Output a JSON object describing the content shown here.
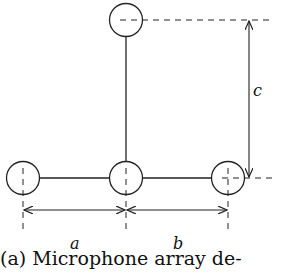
{
  "diagram": {
    "labels": {
      "a": "a",
      "b": "b",
      "c": "c"
    },
    "caption": "(a) Microphone array de-",
    "microphones": [
      {
        "id": "top",
        "x": 126,
        "y": 20
      },
      {
        "id": "left",
        "x": 23,
        "y": 178
      },
      {
        "id": "center",
        "x": 126,
        "y": 178
      },
      {
        "id": "right",
        "x": 228,
        "y": 178
      }
    ],
    "colors": {
      "stroke": "#222222",
      "background": "#ffffff"
    }
  }
}
